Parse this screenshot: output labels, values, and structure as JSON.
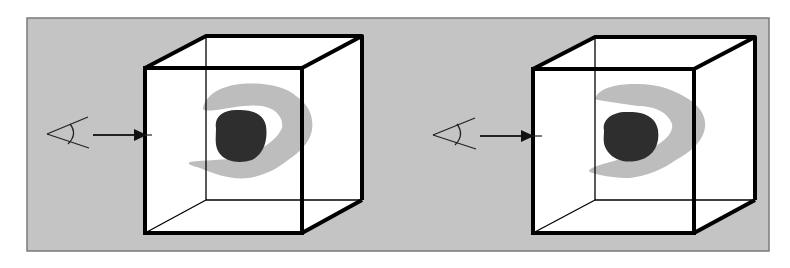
{
  "figure": {
    "type": "diagram",
    "colors": {
      "panel_background": "#c4c4c4",
      "panel_border": "#7a7a7a",
      "cube_face": "#ffffff",
      "cube_edge": "#000000",
      "inner_blob": "#2e2e2e",
      "outer_shell": "#bdbdbd"
    },
    "panels": [
      {
        "id": "left",
        "eye_icon": "eye-icon",
        "arrow_icon": "arrow-right-icon",
        "cube": {
          "front": {
            "x1": 145,
            "y1": 68,
            "x2": 302,
            "y2": 233
          },
          "back": {
            "x1": 206,
            "y1": 36,
            "x2": 362,
            "y2": 200
          }
        },
        "eye": {
          "apex_x": 47,
          "apex_y": 134
        },
        "arrow": {
          "x1": 93,
          "x2": 152,
          "y": 135
        }
      },
      {
        "id": "right",
        "eye_icon": "eye-icon",
        "arrow_icon": "arrow-right-icon",
        "cube": {
          "front": {
            "x1": 533,
            "y1": 69,
            "x2": 694,
            "y2": 233
          },
          "back": {
            "x1": 595,
            "y1": 37,
            "x2": 755,
            "y2": 200
          }
        },
        "eye": {
          "apex_x": 433,
          "apex_y": 135
        },
        "arrow": {
          "x1": 480,
          "x2": 542,
          "y": 136
        }
      }
    ]
  }
}
